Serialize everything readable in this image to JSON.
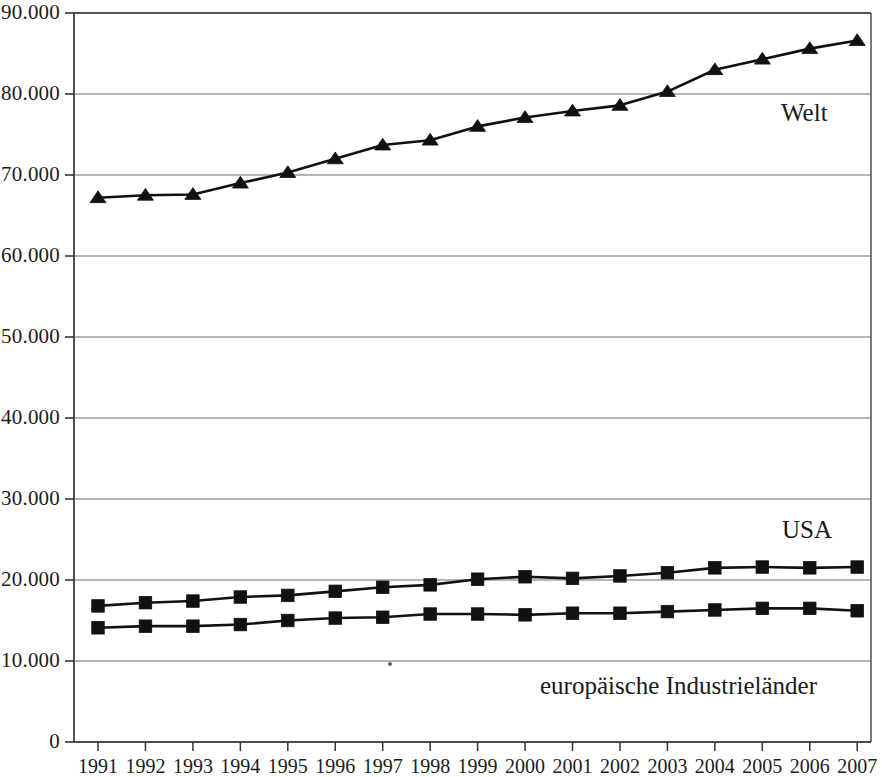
{
  "chart_data": {
    "type": "line",
    "title": "",
    "subtitle": "",
    "xlabel": "",
    "ylabel": "",
    "x": [
      1991,
      1992,
      1993,
      1994,
      1995,
      1996,
      1997,
      1998,
      1999,
      2000,
      2001,
      2002,
      2003,
      2004,
      2005,
      2006,
      2007
    ],
    "categories": [
      "1991",
      "1992",
      "1993",
      "1994",
      "1995",
      "1996",
      "1997",
      "1998",
      "1999",
      "2000",
      "2001",
      "2002",
      "2003",
      "2004",
      "2005",
      "2006",
      "2007"
    ],
    "xtick_labels": [
      "1991",
      "1992",
      "1993",
      "1994",
      "1995",
      "1996",
      "1997",
      "1998",
      "1999",
      "2000",
      "2001",
      "2002",
      "2003",
      "2004",
      "2005",
      "2006",
      "2007"
    ],
    "ytick_labels": [
      "90.000",
      "80.000",
      "70.000",
      "60.000",
      "50.000",
      "40.000",
      "30.000",
      "20.000",
      "10.000",
      "0"
    ],
    "ytick_values": [
      90000,
      80000,
      70000,
      60000,
      50000,
      40000,
      30000,
      20000,
      10000,
      0
    ],
    "ylim": [
      0,
      90000
    ],
    "xlim": [
      1991,
      2007
    ],
    "grid": "horizontal",
    "legend_position": "inline-annotations",
    "number_format": "german-thousands-dot",
    "series": [
      {
        "name": "Welt",
        "label": "Welt",
        "marker": "triangle",
        "color": "#111111",
        "label_x": 781,
        "label_y": 100,
        "values": [
          67200,
          67500,
          67600,
          69000,
          70300,
          72000,
          73700,
          74300,
          76000,
          77100,
          77900,
          78600,
          80300,
          83000,
          84300,
          85600,
          86600
        ]
      },
      {
        "name": "USA",
        "label": "USA",
        "marker": "square",
        "color": "#111111",
        "label_x": 782,
        "label_y": 517,
        "values": [
          16800,
          17200,
          17400,
          17900,
          18100,
          18600,
          19100,
          19400,
          20100,
          20400,
          20200,
          20500,
          20900,
          21500,
          21600,
          21500,
          21600
        ]
      },
      {
        "name": "europäische Industrieländer",
        "label": "europäische Industrieländer",
        "marker": "square",
        "color": "#111111",
        "label_x": 540,
        "label_y": 673,
        "values": [
          14100,
          14300,
          14300,
          14500,
          15000,
          15300,
          15400,
          15800,
          15800,
          15700,
          15900,
          15900,
          16100,
          16300,
          16500,
          16500,
          16200
        ]
      }
    ],
    "axis_color": "#333333",
    "grid_color": "#6f6f6f",
    "background": "#ffffff"
  },
  "artifacts": {
    "speck": {
      "x": 388,
      "y": 662
    }
  }
}
